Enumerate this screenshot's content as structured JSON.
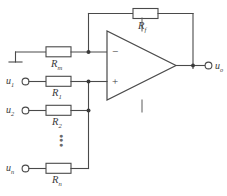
{
  "figure": {
    "kind": "circuit-schematic",
    "line_color": "#4a4a4a",
    "text_color": "#3a3a3a",
    "background": "#ffffff"
  },
  "opamp": {
    "name": "operational-amplifier",
    "inverting_sign": "−",
    "noninverting_sign": "+"
  },
  "feedback": {
    "resistor_label_main": "R",
    "resistor_label_sub": "f"
  },
  "balance_branch": {
    "resistor_label_main": "R",
    "resistor_label_sub": "m",
    "ground": "ground-symbol"
  },
  "inputs": [
    {
      "source_main": "u",
      "source_sub": "1",
      "resistor_main": "R",
      "resistor_sub": "1"
    },
    {
      "source_main": "u",
      "source_sub": "2",
      "resistor_main": "R",
      "resistor_sub": "2"
    },
    {
      "source_main": "u",
      "source_sub": "n",
      "resistor_main": "R",
      "resistor_sub": "n"
    }
  ],
  "continuation": {
    "symbol": "vertical-ellipsis"
  },
  "output": {
    "label_main": "u",
    "label_sub": "o"
  }
}
